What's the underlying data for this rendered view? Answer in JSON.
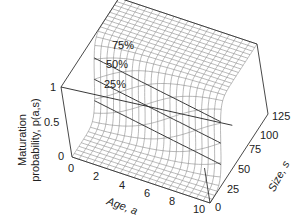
{
  "chart_data": {
    "type": "surface3d",
    "title": "",
    "xlabel": "Age, a",
    "ylabel": "Size, s",
    "zlabel_line1": "Maturation",
    "zlabel_line2": "probability, p(a,s)",
    "x_ticks": [
      "0",
      "2",
      "4",
      "6",
      "8",
      "10"
    ],
    "y_ticks": [
      "0",
      "25",
      "50",
      "75",
      "100",
      "125"
    ],
    "z_ticks": [
      "0",
      "0.5",
      "1"
    ],
    "xlim": [
      0,
      10
    ],
    "ylim": [
      0,
      125
    ],
    "zlim": [
      0,
      1
    ],
    "contour_levels": [
      0.25,
      0.5,
      0.75
    ],
    "contour_labels": [
      "25%",
      "50%",
      "75%"
    ],
    "reaction_norm_midpoint_size_by_age": {
      "x": [
        0,
        2,
        4,
        6,
        8,
        10
      ],
      "s50": [
        60,
        55,
        50,
        45,
        40,
        35
      ]
    },
    "grid": true
  },
  "labels": {
    "z_title_1": "Maturation",
    "z_title_2": "probability, p(a,s)",
    "x_title": "Age, a",
    "y_title": "Size, s",
    "c25": "25%",
    "c50": "50%",
    "c75": "75%",
    "z0": "0",
    "z05": "0.5",
    "z1": "1",
    "x0": "0",
    "x2": "2",
    "x4": "4",
    "x6": "6",
    "x8": "8",
    "x10": "10",
    "y0": "0",
    "y25": "25",
    "y50": "50",
    "y75": "75",
    "y100": "100",
    "y125": "125"
  },
  "colors": {
    "mesh": "#8a8a8a",
    "frame": "#333333",
    "contour": "#222222"
  }
}
